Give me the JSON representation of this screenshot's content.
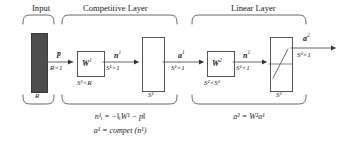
{
  "diagram": {
    "sections": [
      {
        "id": "input",
        "label": "Input"
      },
      {
        "id": "competitive",
        "label": "Competitive Layer"
      },
      {
        "id": "linear",
        "label": "Linear Layer"
      }
    ],
    "input_block": {
      "size_label": "R",
      "fill_color": "#4d4d4d"
    },
    "signals": {
      "p": {
        "name": "p",
        "dims": "R×1"
      },
      "n1": {
        "name": "n",
        "sup": "1",
        "dims": "S¹×1"
      },
      "a1": {
        "name": "a",
        "sup": "1",
        "dims": "S¹×1"
      },
      "n2": {
        "name": "n",
        "sup": "1",
        "dims": "S²×1"
      },
      "a2": {
        "name": "a",
        "sup": "2",
        "dims": "S²×1"
      }
    },
    "weight_blocks": [
      {
        "id": "w1",
        "label": "W",
        "sup": "1",
        "dims": "S¹×R"
      },
      {
        "id": "w2",
        "label": "W",
        "sup": "2",
        "dims": "S²×S¹"
      }
    ],
    "transfer_blocks": [
      {
        "id": "compet",
        "label": "",
        "size_label": "S¹",
        "symbol": "compet-blank"
      },
      {
        "id": "purelin",
        "label": "",
        "size_label": "S²",
        "symbol": "linear-slope"
      }
    ],
    "equations": {
      "competitive": [
        "n¹ᵢ = −‖ᵢW¹ − p‖",
        "a¹ = compet (n¹)"
      ],
      "linear": [
        "a² = W²a¹"
      ]
    },
    "colors": {
      "stroke": "#555555",
      "text": "#1a1a1a",
      "input_fill": "#4d4d4d",
      "background": "#ffffff"
    }
  }
}
